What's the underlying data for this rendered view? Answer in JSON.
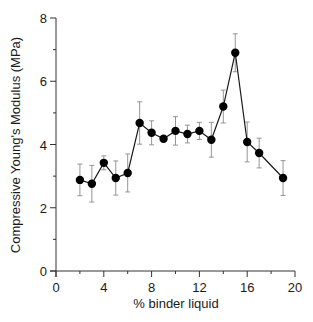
{
  "chart_data": {
    "type": "line",
    "title": "",
    "xlabel": "% binder liquid",
    "ylabel": "Compressive Young's Modulus (MPa)",
    "xlim": [
      0,
      20
    ],
    "ylim": [
      0,
      8
    ],
    "x_major_ticks": [
      0,
      4,
      8,
      12,
      16,
      20
    ],
    "x_minor_ticks": [
      2,
      6,
      10,
      14,
      18
    ],
    "y_major_ticks": [
      0,
      2,
      4,
      6,
      8
    ],
    "y_minor_ticks": [
      1,
      3,
      5,
      7
    ],
    "grid": false,
    "legend": null,
    "series": [
      {
        "name": "Compressive Young's Modulus",
        "marker": "filled-circle",
        "color": "#000000",
        "x": [
          2,
          3,
          4,
          5,
          6,
          7,
          8,
          9,
          10,
          11,
          12,
          13,
          14,
          15,
          16,
          17,
          19
        ],
        "y": [
          2.88,
          2.76,
          3.42,
          2.94,
          3.1,
          4.68,
          4.37,
          4.18,
          4.43,
          4.33,
          4.43,
          4.15,
          5.2,
          6.9,
          4.08,
          3.73,
          2.94
        ],
        "error": [
          0.5,
          0.58,
          0.22,
          0.54,
          0.6,
          0.67,
          0.38,
          0.0,
          0.45,
          0.28,
          0.27,
          0.55,
          0.52,
          0.6,
          0.63,
          0.47,
          0.55
        ]
      }
    ]
  },
  "axes": {
    "x_title": "% binder liquid",
    "y_title": "Compressive Young's Modulus (MPa)"
  },
  "colors": {
    "line": "#1a1a1a",
    "marker": "#000000",
    "errorbar": "#8a8a8a",
    "axis": "#333333"
  }
}
